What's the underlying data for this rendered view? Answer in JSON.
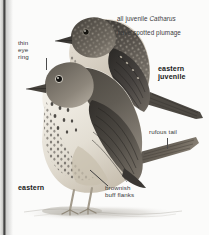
{
  "plate": {
    "domain": "field-guide-illustration",
    "subject": "Catharus thrush — eastern adult and juvenile",
    "background_color": "#fbfbfa",
    "ink_color": "#39393a",
    "bold_ink_color": "#171718"
  },
  "annotations": {
    "juvenile_note": {
      "line1_prefix": "all juvenile ",
      "line1_italic": "Catharus",
      "line2": "have spotted plumage"
    },
    "thin_eye_ring": "thin\neye\nring",
    "eastern_juvenile": "eastern\njuvenile",
    "rufous_tail": "rufous tail",
    "eastern": "eastern",
    "brownish_buff_flanks": "brownish\nbuff flanks"
  },
  "birds": {
    "juvenile": {
      "name": "eastern juvenile",
      "plumage": "spotted / scaled buff-tipped upperparts",
      "upper_tone": "#4a4640",
      "under_tone": "#d9d2c6",
      "spot_tone": "#2b2825"
    },
    "adult": {
      "name": "eastern",
      "plumage": "grey-brown above, spotted breast, rufous tail",
      "upper_tone": "#55514a",
      "under_tone": "#efece4",
      "flank_tone": "#cfc6b4",
      "tail_tone": "#5b544a"
    }
  },
  "ground": {
    "shadow_tone": "#c9c6c0"
  }
}
